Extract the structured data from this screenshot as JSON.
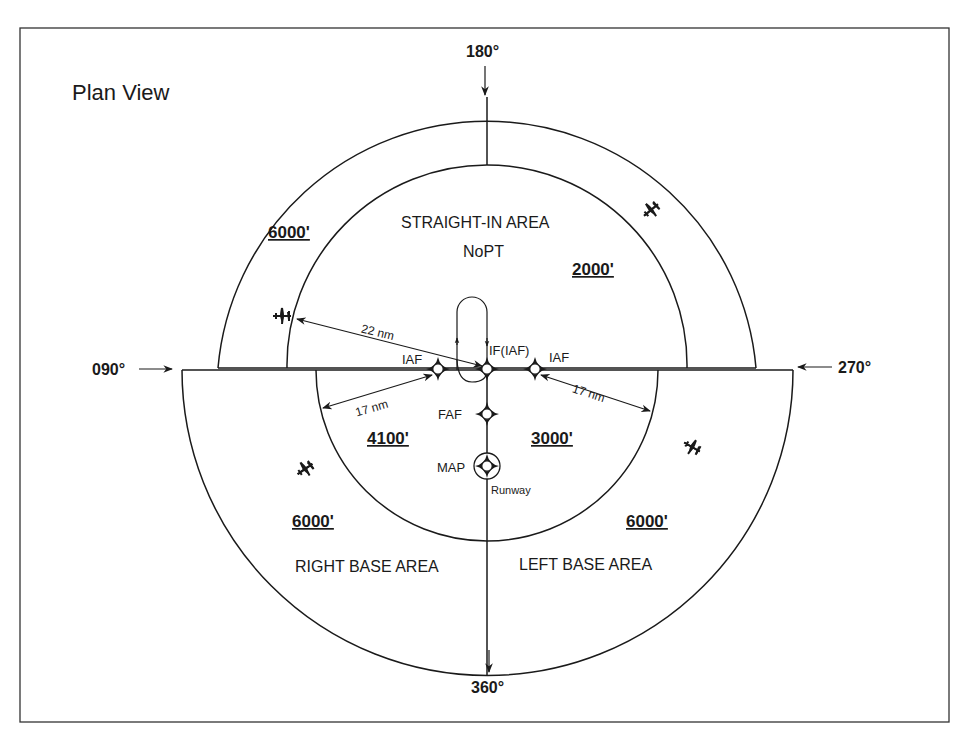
{
  "title": "Plan View",
  "headings": {
    "north": "180°",
    "west": "090°",
    "east": "270°",
    "south": "360°"
  },
  "areas": {
    "straight_in": "STRAIGHT-IN AREA",
    "straight_in_sub": "NoPT",
    "right_base": "RIGHT BASE AREA",
    "left_base": "LEFT BASE AREA"
  },
  "altitudes": {
    "outer_northwest": "6000'",
    "straight_in": "2000'",
    "inner_right_base": "4100'",
    "inner_left_base": "3000'",
    "outer_right_base": "6000'",
    "outer_left_base": "6000'"
  },
  "fixes": {
    "iaf_left": "IAF",
    "if_iaf": "IF(IAF)",
    "iaf_right": "IAF",
    "faf": "FAF",
    "map": "MAP",
    "runway": "Runway"
  },
  "distances": {
    "straight_in_radius": "22 nm",
    "left_base_radius": "17 nm",
    "right_base_radius": "17 nm"
  },
  "icons": {
    "aircraft": "airplane-icon",
    "fix": "waypoint-diamond-icon",
    "heading_arrow": "arrow-icon"
  },
  "colors": {
    "line": "#1a1a1a",
    "background": "#ffffff"
  }
}
